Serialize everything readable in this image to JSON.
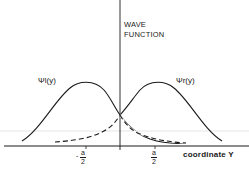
{
  "diagram": {
    "y_axis_title_line1": "WAVE",
    "y_axis_title_line2": "FUNCTION",
    "x_axis_title": "coordinate Y",
    "curve_left_label": "Ψl(y)",
    "curve_right_label": "Ψr(y)",
    "ticks": [
      {
        "sign": "-",
        "numerator": "a",
        "denominator": "2"
      },
      {
        "sign": "",
        "numerator": "a",
        "denominator": "2"
      }
    ],
    "colors": {
      "ink": "#1a1a1a",
      "background": "#ffffff",
      "guide": "#c8c8c8"
    }
  }
}
